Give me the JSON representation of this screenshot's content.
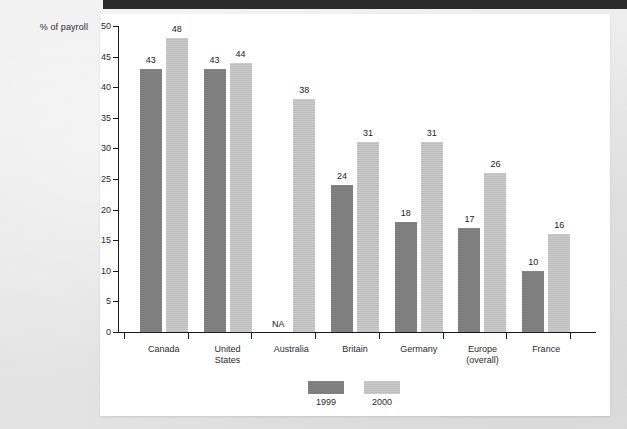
{
  "page": {
    "background_color": "#e9e9e9",
    "panel_color": "#ffffff",
    "top_rule_color": "#2b2b2b"
  },
  "chart_data": {
    "type": "bar",
    "title": "",
    "subtitle": "",
    "xlabel": "",
    "ylabel": "% of payroll",
    "ylim": [
      0,
      50
    ],
    "ytick_step": 5,
    "yticks": [
      "0",
      "5",
      "10",
      "15",
      "20",
      "25",
      "30",
      "35",
      "40",
      "45",
      "50"
    ],
    "grid": false,
    "legend_position": "bottom-center",
    "categories": [
      "Canada",
      "United\nStates",
      "Australia",
      "Britain",
      "Germany",
      "Europe\n(overall)",
      "France"
    ],
    "series": [
      {
        "name": "1999",
        "color": "#7e7e7e",
        "values": [
          43,
          43,
          null,
          24,
          18,
          17,
          10
        ],
        "labels": [
          "43",
          "43",
          "NA",
          "24",
          "18",
          "17",
          "10"
        ]
      },
      {
        "name": "2000",
        "color": "#c2c2c2",
        "values": [
          48,
          44,
          38,
          31,
          31,
          26,
          16
        ],
        "labels": [
          "48",
          "44",
          "38",
          "31",
          "31",
          "26",
          "16"
        ]
      }
    ],
    "annotations": [
      {
        "text": "NA",
        "category": "Australia",
        "series": "1999"
      }
    ]
  },
  "legend": {
    "items": [
      {
        "label": "1999",
        "color": "#7e7e7e"
      },
      {
        "label": "2000",
        "color": "#c2c2c2"
      }
    ]
  }
}
